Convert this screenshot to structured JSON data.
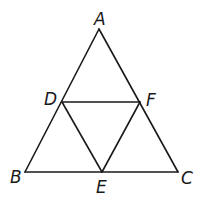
{
  "diagram": {
    "type": "geometry",
    "points": {
      "A": {
        "label": "A",
        "x": 99,
        "y": 29
      },
      "B": {
        "label": "B",
        "x": 25,
        "y": 172
      },
      "C": {
        "label": "C",
        "x": 178,
        "y": 172
      },
      "D": {
        "label": "D",
        "x": 62,
        "y": 102
      },
      "E": {
        "label": "E",
        "x": 102,
        "y": 172
      },
      "F": {
        "label": "F",
        "x": 140,
        "y": 102
      }
    },
    "segments": [
      [
        "A",
        "B"
      ],
      [
        "A",
        "C"
      ],
      [
        "B",
        "C"
      ],
      [
        "D",
        "F"
      ],
      [
        "D",
        "E"
      ],
      [
        "E",
        "F"
      ]
    ],
    "line_color": "#1a1a1a"
  }
}
